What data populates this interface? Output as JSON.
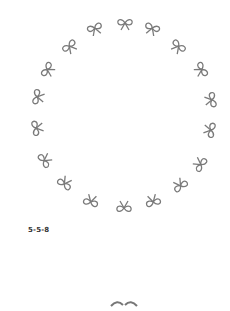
{
  "figure": {
    "caption": "5-5-8",
    "ink_color": "#7a7a7a",
    "bows": [
      {
        "x": 125,
        "y": 24,
        "rot": 0
      },
      {
        "x": 152,
        "y": 29,
        "rot": 20
      },
      {
        "x": 178,
        "y": 47,
        "rot": 40
      },
      {
        "x": 201,
        "y": 70,
        "rot": 60
      },
      {
        "x": 211,
        "y": 100,
        "rot": 80
      },
      {
        "x": 210,
        "y": 130,
        "rot": 100
      },
      {
        "x": 200,
        "y": 164,
        "rot": 125
      },
      {
        "x": 180,
        "y": 185,
        "rot": 145
      },
      {
        "x": 153,
        "y": 201,
        "rot": 165
      },
      {
        "x": 124,
        "y": 207,
        "rot": 180
      },
      {
        "x": 91,
        "y": 201,
        "rot": 195
      },
      {
        "x": 65,
        "y": 183,
        "rot": 215
      },
      {
        "x": 45,
        "y": 160,
        "rot": 235
      },
      {
        "x": 37,
        "y": 128,
        "rot": 260
      },
      {
        "x": 38,
        "y": 97,
        "rot": 280
      },
      {
        "x": 48,
        "y": 70,
        "rot": 300
      },
      {
        "x": 70,
        "y": 47,
        "rot": 320
      },
      {
        "x": 95,
        "y": 29,
        "rot": 340
      }
    ]
  }
}
